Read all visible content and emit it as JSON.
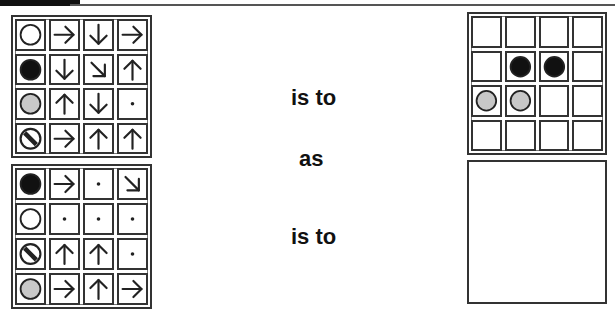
{
  "words": {
    "is_to_1": "is to",
    "as": "as",
    "is_to_2": "is to"
  },
  "colors": {
    "black": "#111111",
    "grey": "#c8c8c8",
    "white": "#ffffff",
    "line": "#222222"
  },
  "grids": {
    "top_left": {
      "rows": [
        [
          "circle-white",
          "arrow-right",
          "arrow-down",
          "arrow-right"
        ],
        [
          "circle-black",
          "arrow-down",
          "arrow-down-right",
          "arrow-up"
        ],
        [
          "circle-grey",
          "arrow-up",
          "arrow-down",
          "dot"
        ],
        [
          "circle-striped",
          "arrow-right",
          "arrow-up",
          "arrow-up"
        ]
      ]
    },
    "bottom_left": {
      "rows": [
        [
          "circle-black",
          "arrow-right",
          "dot",
          "arrow-down-right"
        ],
        [
          "circle-white",
          "dot",
          "dot",
          "dot"
        ],
        [
          "circle-striped",
          "arrow-up",
          "arrow-up",
          "dot"
        ],
        [
          "circle-grey",
          "arrow-right",
          "arrow-up",
          "arrow-right"
        ]
      ]
    },
    "top_right": {
      "rows": [
        [
          "empty",
          "empty",
          "empty",
          "empty"
        ],
        [
          "empty",
          "circle-black",
          "circle-black",
          "empty"
        ],
        [
          "circle-grey",
          "circle-grey",
          "empty",
          "empty"
        ],
        [
          "empty",
          "empty",
          "empty",
          "empty"
        ]
      ]
    }
  },
  "answer_box": {
    "content": ""
  }
}
